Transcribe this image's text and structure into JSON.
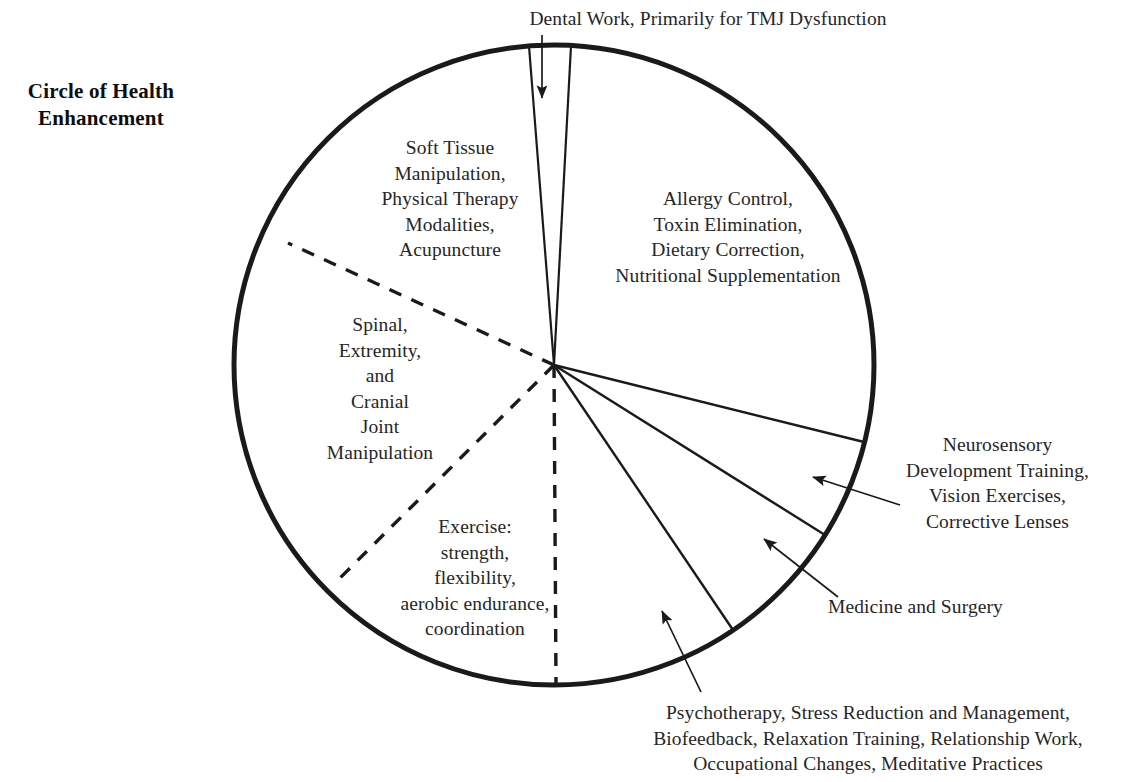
{
  "title": {
    "text": "Circle of Health\nEnhancement"
  },
  "colors": {
    "stroke": "#1a1a1a",
    "text": "#262626",
    "background": "#ffffff"
  },
  "diagram": {
    "type": "pie",
    "shape": "circle",
    "center": {
      "x": 554,
      "y": 365
    },
    "radius": 320,
    "outline_width": 5
  },
  "segments": [
    {
      "id": "dental-work",
      "label": "Dental Work, Primarily for TMJ Dysfunction",
      "label_position": "top-outside",
      "divider_style": "solid",
      "has_leader_arrow": true,
      "start_angle_deg": -94.5,
      "end_angle_deg": -86.5
    },
    {
      "id": "soft-tissue",
      "label": "Soft Tissue\nManipulation,\nPhysical Therapy\nModalities,\nAcupuncture",
      "label_position": "upper-left-inside",
      "divider_style": "mixed",
      "has_leader_arrow": false,
      "start_angle_deg": -157.5,
      "end_angle_deg": -94.5
    },
    {
      "id": "spinal-extremity-cranial",
      "label": "Spinal,\nExtremity,\nand\nCranial\nJoint\nManipulation",
      "label_position": "left-inside",
      "divider_style": "dashed",
      "has_leader_arrow": false,
      "start_angle_deg": 135.0,
      "end_angle_deg": -157.5
    },
    {
      "id": "exercise",
      "label": "Exercise:\nstrength,\nflexibility,\naerobic endurance,\ncoordination",
      "label_position": "lower-left-inside",
      "divider_style": "dashed",
      "has_leader_arrow": false,
      "start_angle_deg": 90.0,
      "end_angle_deg": 135.0
    },
    {
      "id": "psychotherapy",
      "label": "Psychotherapy, Stress Reduction and Management,\nBiofeedback, Relaxation Training, Relationship Work,\nOccupational Changes, Meditative Practices",
      "label_position": "bottom-outside",
      "divider_style": "mixed",
      "has_leader_arrow": true,
      "start_angle_deg": 56.0,
      "end_angle_deg": 90.0
    },
    {
      "id": "medicine-surgery",
      "label": "Medicine and Surgery",
      "label_position": "right-outside",
      "divider_style": "solid",
      "has_leader_arrow": true,
      "start_angle_deg": 32.0,
      "end_angle_deg": 56.0
    },
    {
      "id": "neurosensory",
      "label": "Neurosensory\nDevelopment Training,\nVision Exercises,\nCorrective Lenses",
      "label_position": "right-outside",
      "divider_style": "solid",
      "has_leader_arrow": true,
      "start_angle_deg": 14.0,
      "end_angle_deg": 32.0
    },
    {
      "id": "allergy-nutrition",
      "label": "Allergy Control,\nToxin Elimination,\nDietary Correction,\nNutritional Supplementation",
      "label_position": "upper-right-inside",
      "divider_style": "solid",
      "has_leader_arrow": false,
      "start_angle_deg": -86.5,
      "end_angle_deg": 14.0
    }
  ]
}
